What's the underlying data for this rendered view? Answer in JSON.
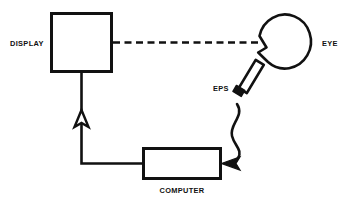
{
  "figure": {
    "type": "block-diagram",
    "background_color": "#ffffff",
    "line_color": "#111111"
  },
  "nodes": [
    {
      "id": "display",
      "label": "DISPLAY",
      "shape": "rectangle",
      "label_position": "left-outside",
      "x": 50,
      "y": 12,
      "width": 63,
      "height": 61
    },
    {
      "id": "eye",
      "label": "EYE",
      "shape": "circle-with-cornea",
      "label_position": "right-outside",
      "cx": 284,
      "cy": 43,
      "r": 26
    },
    {
      "id": "eps",
      "label": "EPS",
      "shape": "tilted-elongated-rectangle",
      "label_position": "left-outside",
      "angle_deg": -45
    },
    {
      "id": "computer",
      "label": "COMPUTER",
      "shape": "rectangle",
      "label_position": "below-outside",
      "x": 142,
      "y": 147,
      "width": 80,
      "height": 33
    }
  ],
  "connections": [
    {
      "id": "display-to-eye",
      "from": "display",
      "to": "eye",
      "style": "dashed",
      "arrowhead": "none",
      "meaning": "line of sight / visual stimulus"
    },
    {
      "id": "eps-to-computer",
      "from": "eps",
      "to": "computer",
      "style": "curved-solid",
      "arrowhead": "filled-triangle-left",
      "meaning": "eye position signal"
    },
    {
      "id": "computer-to-display",
      "from": "computer",
      "to": "display",
      "style": "orthogonal-solid",
      "arrowhead": "hollow-triangle-up",
      "meaning": "display drive signal"
    }
  ],
  "labels": {
    "display": "DISPLAY",
    "eye": "EYE",
    "eps": "EPS",
    "computer": "COMPUTER"
  }
}
